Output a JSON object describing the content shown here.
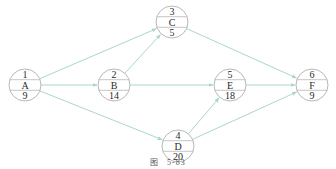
{
  "diagram": {
    "type": "activity-on-node network",
    "colors": {
      "edge": "#a9d9c6",
      "node_border": "#b8b8b8",
      "text": "#2a2a2a"
    },
    "nodes": [
      {
        "id": "1",
        "number": "1",
        "activity": "A",
        "duration": "9",
        "cx": 25,
        "cy": 85
      },
      {
        "id": "2",
        "number": "2",
        "activity": "B",
        "duration": "14",
        "cx": 114,
        "cy": 85
      },
      {
        "id": "3",
        "number": "3",
        "activity": "C",
        "duration": "5",
        "cx": 172,
        "cy": 22
      },
      {
        "id": "4",
        "number": "4",
        "activity": "D",
        "duration": "20",
        "cx": 178,
        "cy": 146
      },
      {
        "id": "5",
        "number": "5",
        "activity": "E",
        "duration": "18",
        "cx": 230,
        "cy": 85
      },
      {
        "id": "6",
        "number": "6",
        "activity": "F",
        "duration": "9",
        "cx": 312,
        "cy": 85
      }
    ],
    "edges": [
      {
        "from": "1",
        "to": "2"
      },
      {
        "from": "1",
        "to": "3"
      },
      {
        "from": "1",
        "to": "4"
      },
      {
        "from": "2",
        "to": "3"
      },
      {
        "from": "2",
        "to": "5"
      },
      {
        "from": "3",
        "to": "6"
      },
      {
        "from": "4",
        "to": "5"
      },
      {
        "from": "4",
        "to": "6"
      },
      {
        "from": "5",
        "to": "6"
      }
    ]
  },
  "caption": {
    "label": "图",
    "number": "5-83"
  }
}
